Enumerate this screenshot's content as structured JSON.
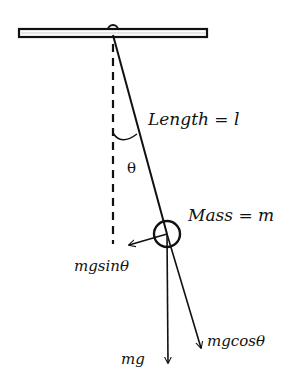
{
  "diagram": {
    "labels": {
      "length": "Length = l",
      "theta": "θ",
      "mass": "Mass = m",
      "tangential_force": "mgsinθ",
      "radial_force": "mgcosθ",
      "weight": "mg"
    },
    "colors": {
      "stroke": "#111111",
      "background": "#ffffff"
    }
  }
}
